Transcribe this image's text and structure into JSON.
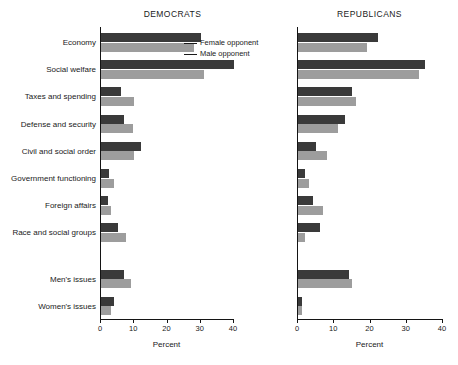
{
  "chart_data": {
    "type": "bar",
    "orientation": "horizontal",
    "title": "",
    "xlabel": "Percent",
    "ylabel": "",
    "xlim": [
      0,
      40
    ],
    "xticks": [
      0,
      10,
      20,
      30,
      40
    ],
    "grid": false,
    "legend_position": "upper-center-left-panel",
    "legend": [
      "Female opponent",
      "Male opponent"
    ],
    "categories": [
      "Economy",
      "Social welfare",
      "Taxes and spending",
      "Defense and security",
      "Civil and social order",
      "Government functioning",
      "Foreign affairs",
      "Race and social groups",
      "Men's issues",
      "Women's issues"
    ],
    "panels": [
      {
        "name": "DEMOCRATS",
        "series": [
          {
            "name": "Female opponent",
            "values": [
              30,
              40,
              6,
              7,
              12,
              2.5,
              2,
              5,
              7,
              4
            ]
          },
          {
            "name": "Male opponent",
            "values": [
              28,
              31,
              10,
              9.5,
              10,
              4,
              3,
              7.5,
              9,
              3
            ]
          }
        ]
      },
      {
        "name": "REPUBLICANS",
        "series": [
          {
            "name": "Female opponent",
            "values": [
              22,
              35,
              15,
              13,
              5,
              2,
              4,
              6,
              14,
              1
            ]
          },
          {
            "name": "Male opponent",
            "values": [
              19,
              33.5,
              16,
              11,
              8,
              3,
              7,
              2,
              15,
              1
            ]
          }
        ]
      }
    ]
  },
  "colors": {
    "female": "#3a3a3a",
    "male": "#9d9d9d",
    "axis": "#141414",
    "background": "#ffffff"
  }
}
